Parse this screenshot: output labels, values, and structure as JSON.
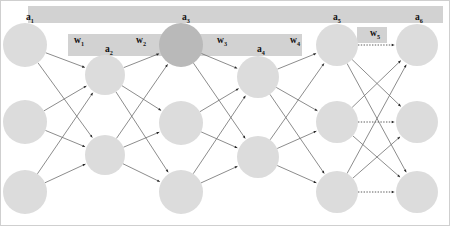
{
  "figure": {
    "name": "neural-network-backpropagation-path",
    "width": 450,
    "height": 226,
    "background": "#ffffff"
  },
  "colors": {
    "node_fill": "#dcdcdc",
    "node_highlight_fill": "#b9b9b9",
    "edge": "#6f6f6f",
    "arrow": "#262626",
    "highlight_band": "#d2d2d2",
    "label_text": "#111111"
  },
  "activation_labels": [
    {
      "id": "a1",
      "base": "a",
      "sub": "1",
      "x": 26,
      "y": 20
    },
    {
      "id": "a2",
      "base": "a",
      "sub": "2",
      "x": 105,
      "y": 52
    },
    {
      "id": "a3",
      "base": "a",
      "sub": "3",
      "x": 182,
      "y": 20
    },
    {
      "id": "a4",
      "base": "a",
      "sub": "4",
      "x": 257,
      "y": 52
    },
    {
      "id": "a5",
      "base": "a",
      "sub": "5",
      "x": 333,
      "y": 20
    },
    {
      "id": "a6",
      "base": "a",
      "sub": "6",
      "x": 415,
      "y": 20
    }
  ],
  "weight_labels": [
    {
      "id": "w1",
      "base": "w",
      "sub": "1",
      "x": 74,
      "y": 43
    },
    {
      "id": "w2",
      "base": "w",
      "sub": "2",
      "x": 136,
      "y": 43
    },
    {
      "id": "w3",
      "base": "w",
      "sub": "3",
      "x": 217,
      "y": 43
    },
    {
      "id": "w4",
      "base": "w",
      "sub": "4",
      "x": 290,
      "y": 43
    },
    {
      "id": "w5",
      "base": "w",
      "sub": "5",
      "x": 370,
      "y": 36
    }
  ],
  "highlight_bands": [
    {
      "id": "band-top",
      "x": 28,
      "y": 6,
      "w": 415,
      "h": 17
    },
    {
      "id": "band-middle",
      "x": 68,
      "y": 34,
      "w": 234,
      "h": 22
    },
    {
      "id": "band-w5",
      "x": 357,
      "y": 27,
      "w": 30,
      "h": 16
    }
  ],
  "layers": [
    {
      "id": "layer-1",
      "x": 25,
      "radius": 22,
      "nodes": [
        {
          "id": "n1-1",
          "y": 45,
          "highlight": false
        },
        {
          "id": "n1-2",
          "y": 122,
          "highlight": false
        },
        {
          "id": "n1-3",
          "y": 192,
          "highlight": false
        }
      ]
    },
    {
      "id": "layer-2",
      "x": 105,
      "radius": 20,
      "nodes": [
        {
          "id": "n2-1",
          "y": 75,
          "highlight": false
        },
        {
          "id": "n2-2",
          "y": 155,
          "highlight": false
        }
      ]
    },
    {
      "id": "layer-3",
      "x": 181,
      "radius": 22,
      "nodes": [
        {
          "id": "n3-1",
          "y": 45,
          "highlight": true
        },
        {
          "id": "n3-2",
          "y": 123,
          "highlight": false
        },
        {
          "id": "n3-3",
          "y": 192,
          "highlight": false
        }
      ]
    },
    {
      "id": "layer-4",
      "x": 258,
      "radius": 21,
      "nodes": [
        {
          "id": "n4-1",
          "y": 77,
          "highlight": false
        },
        {
          "id": "n4-2",
          "y": 157,
          "highlight": false
        }
      ]
    },
    {
      "id": "layer-5",
      "x": 337,
      "radius": 21,
      "nodes": [
        {
          "id": "n5-1",
          "y": 45,
          "highlight": false
        },
        {
          "id": "n5-2",
          "y": 122,
          "highlight": false
        },
        {
          "id": "n5-3",
          "y": 192,
          "highlight": false
        }
      ]
    },
    {
      "id": "layer-6",
      "x": 417,
      "radius": 21,
      "nodes": [
        {
          "id": "n6-1",
          "y": 45,
          "highlight": false
        },
        {
          "id": "n6-2",
          "y": 122,
          "highlight": false
        },
        {
          "id": "n6-3",
          "y": 192,
          "highlight": false
        }
      ]
    }
  ],
  "connections": [
    {
      "from": "layer-1",
      "to": "layer-2",
      "style": "solid"
    },
    {
      "from": "layer-2",
      "to": "layer-3",
      "style": "solid"
    },
    {
      "from": "layer-3",
      "to": "layer-4",
      "style": "solid"
    },
    {
      "from": "layer-4",
      "to": "layer-5",
      "style": "solid"
    },
    {
      "from": "layer-5",
      "to": "layer-6",
      "style": "mixed"
    }
  ],
  "dotted_edges": [
    {
      "from": "n5-1",
      "to": "n6-1"
    },
    {
      "from": "n5-2",
      "to": "n6-2"
    },
    {
      "from": "n5-3",
      "to": "n6-3"
    }
  ]
}
